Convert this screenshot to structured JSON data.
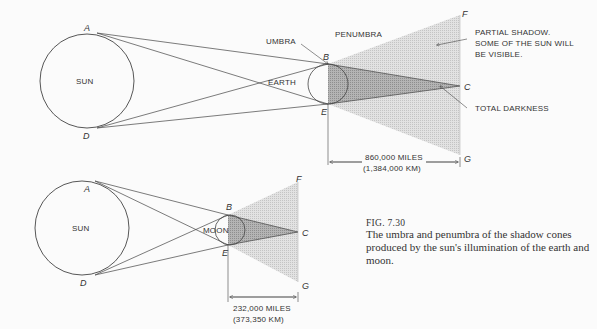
{
  "figure": {
    "number": "FIG. 7.30",
    "caption": "The umbra and penumbra of the shadow cones produced by the sun's illumination of the earth and moon."
  },
  "earth_diagram": {
    "sun_label": "SUN",
    "body_label": "EARTH",
    "umbra_label": "UMBRA",
    "penumbra_label": "PENUMBRA",
    "partial_shadow_note": [
      "PARTIAL SHADOW.",
      "SOME OF THE SUN WILL",
      "BE VISIBLE."
    ],
    "total_darkness_note": "TOTAL DARKNESS",
    "distance_miles": "860,000 MILES",
    "distance_km": "(1,384,000 KM)",
    "points": {
      "A": "A",
      "B": "B",
      "C": "C",
      "D": "D",
      "E": "E",
      "F": "F",
      "G": "G"
    }
  },
  "moon_diagram": {
    "sun_label": "SUN",
    "body_label": "MOON",
    "distance_miles": "232,000 MILES",
    "distance_km": "(373,350 KM)",
    "points": {
      "A": "A",
      "B": "B",
      "C": "C",
      "D": "D",
      "E": "E",
      "F": "F",
      "G": "G"
    }
  },
  "colors": {
    "line": "#444444",
    "penumbra": "#d8d8d8",
    "umbra": "#a9a9a9",
    "background": "#fbfbfb"
  }
}
